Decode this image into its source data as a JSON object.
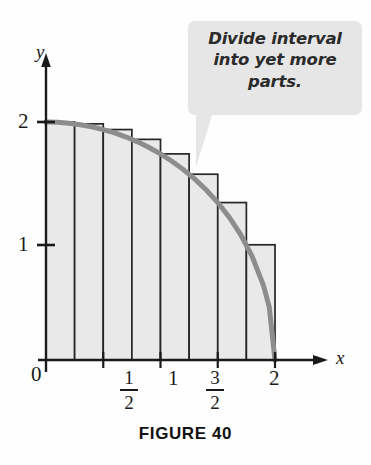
{
  "figure": {
    "caption": "FIGURE 40",
    "callout": {
      "text": "Divide interval into yet more parts.",
      "line1": "Divide interval",
      "line2": "into yet more",
      "line3": "parts.",
      "background_color": "#e6e6e6"
    }
  },
  "axes": {
    "x_label": "x",
    "y_label": "y",
    "origin_label": "0",
    "x_ticks": [
      {
        "value": 0.5,
        "label": "1/2",
        "numerator": "1",
        "denominator": "2"
      },
      {
        "value": 1,
        "label": "1"
      },
      {
        "value": 1.5,
        "label": "3/2",
        "numerator": "3",
        "denominator": "2"
      },
      {
        "value": 2,
        "label": "2"
      }
    ],
    "y_ticks": [
      {
        "value": 1,
        "label": "1"
      },
      {
        "value": 2,
        "label": "2"
      }
    ]
  },
  "chart_data": {
    "type": "area",
    "title": "FIGURE 40",
    "xlabel": "x",
    "ylabel": "y",
    "xlim": [
      0,
      2.28
    ],
    "ylim": [
      0,
      2.32
    ],
    "grid": false,
    "legend": false,
    "annotations": [
      {
        "text": "Divide interval into yet more parts.",
        "type": "callout",
        "points_to_x": 1.28,
        "points_to_y": 1.53
      }
    ],
    "curve": {
      "name": "quarter circle y = sqrt(4 - x^2)",
      "equation": "y = sqrt(4 - x^2)",
      "color": "#8d8d8d",
      "stroke_width": 5,
      "x": [
        0,
        0.1,
        0.2,
        0.3,
        0.4,
        0.5,
        0.6,
        0.7,
        0.8,
        0.9,
        1.0,
        1.1,
        1.2,
        1.3,
        1.4,
        1.5,
        1.6,
        1.7,
        1.8,
        1.9,
        1.95,
        2.0
      ],
      "y": [
        2.0,
        1.9975,
        1.99,
        1.9774,
        1.9596,
        1.9365,
        1.9079,
        1.8735,
        1.833,
        1.7861,
        1.7321,
        1.6703,
        1.6,
        1.5199,
        1.4283,
        1.3229,
        1.2,
        1.0536,
        0.8718,
        0.6245,
        0.4444,
        0.0
      ]
    },
    "rectangles": {
      "method": "left endpoint Riemann sum",
      "count": 8,
      "width": 0.25,
      "fill_color": "#e9e9e9",
      "edge_color": "#262626",
      "left_edges": [
        0,
        0.25,
        0.5,
        0.75,
        1.0,
        1.25,
        1.5,
        1.75
      ],
      "heights": [
        2.0,
        1.9843,
        1.9365,
        1.854,
        1.7321,
        1.5612,
        1.3229,
        0.9682
      ]
    }
  }
}
